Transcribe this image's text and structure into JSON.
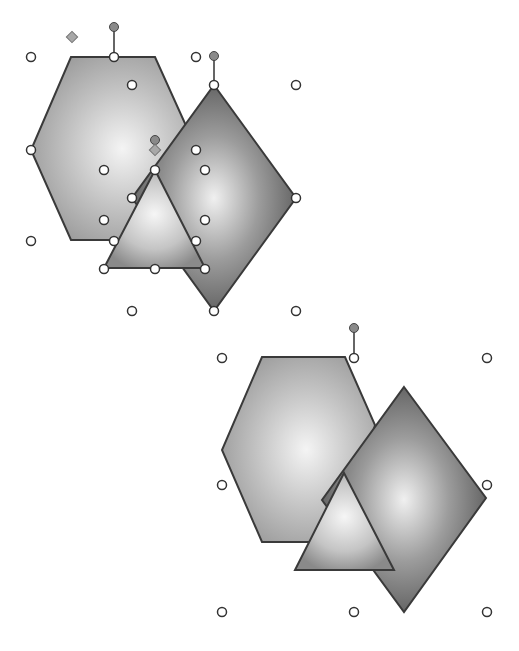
{
  "figure": {
    "colors": {
      "background": "#ffffff",
      "hexagon_center": "#f4f4f4",
      "hexagon_edge": "#9a9a9a",
      "diamond_center": "#f0f0f0",
      "diamond_edge": "#5a5a5a",
      "triangle_center": "#f6f6f6",
      "triangle_edge": "#8a8a8a",
      "outline": "#3a3a3a",
      "rotation_handle": "#8a8a8a",
      "adjust_handle": "#a8a8a8"
    },
    "top_group": {
      "state": "ungrouped-selected",
      "shapes": [
        "hexagon",
        "diamond",
        "triangle"
      ]
    },
    "bottom_group": {
      "state": "grouped-selected",
      "shapes": [
        "hexagon",
        "diamond",
        "triangle"
      ]
    }
  }
}
